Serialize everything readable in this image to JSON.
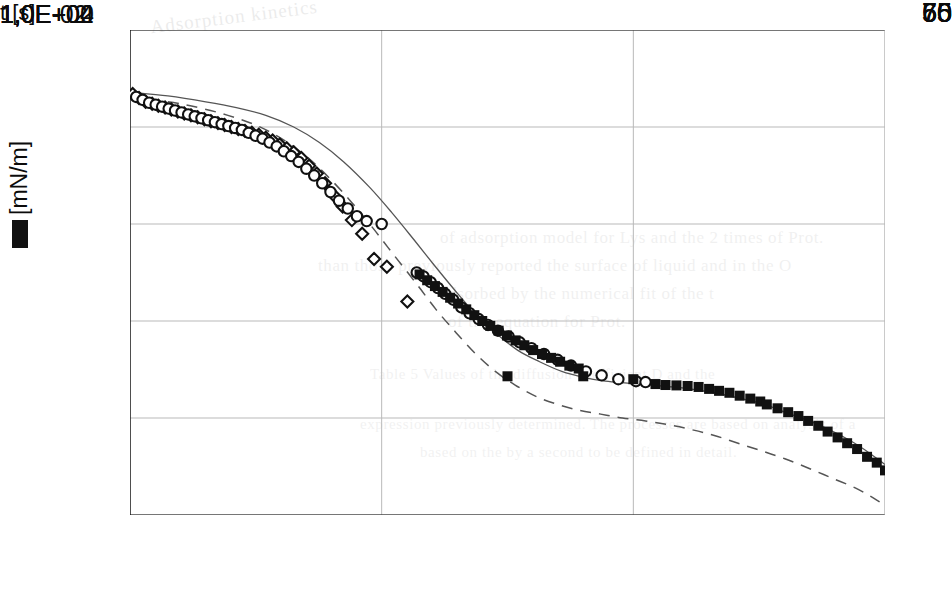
{
  "figure": {
    "axis_color": "#111111",
    "grid_color": "#b9b9b9",
    "marker_color": "#111111",
    "fit_color": "#555555"
  },
  "yaxis": {
    "title_symbol": "redacted-gamma-symbol",
    "title_units": "[mN/m]",
    "ticks": [
      "75",
      "70",
      "65",
      "60",
      "55",
      "50"
    ]
  },
  "xaxis": {
    "title": "t [s]",
    "ticks": [
      "1,0E-02",
      "1,0E+00",
      "1,0E+02",
      "1,0E+04"
    ]
  },
  "background_text": {
    "header": "Adsorption kinetics",
    "lines": [
      "of  adsorption  model  for  Lys  and  the  2  times  of  Prot.",
      "than  those  previously  reported  the  surface  of  liquid  and  in  the  O",
      "adsorbed  by  the  numerical  fit  of  the  t",
      "of  the  equation  for  Prot.",
      "Table 5  Values  of  the  diffusion  coefficient  D  and  the",
      "expression  previously  determined.  The  processes  are  based  on  analysis  of  a",
      "based  on  the  by  a  second  to  be  defined  in  detail."
    ]
  },
  "chart_data": {
    "type": "scatter",
    "title": "",
    "xlabel": "t [s]",
    "ylabel": "[mN/m]",
    "xscale": "log",
    "xlim": [
      0.01,
      10000
    ],
    "ylim": [
      50,
      75
    ],
    "xticks": [
      0.01,
      1,
      100,
      10000
    ],
    "xticklabels": [
      "1,0E-02",
      "1,0E+00",
      "1,0E+02",
      "1,0E+04"
    ],
    "yticks": [
      50,
      55,
      60,
      65,
      70,
      75
    ],
    "grid": true,
    "legend": "none",
    "series": [
      {
        "name": "open-diamonds",
        "marker": "open-diamond",
        "points": [
          [
            0.0105,
            71.7
          ],
          [
            0.0118,
            71.5
          ],
          [
            0.0133,
            71.3
          ],
          [
            0.015,
            71.2
          ],
          [
            0.0168,
            71.1
          ],
          [
            0.019,
            71.0
          ],
          [
            0.0213,
            70.9
          ],
          [
            0.024,
            70.8
          ],
          [
            0.027,
            70.7
          ],
          [
            0.0305,
            70.6
          ],
          [
            0.0345,
            70.5
          ],
          [
            0.039,
            70.4
          ],
          [
            0.044,
            70.3
          ],
          [
            0.05,
            70.2
          ],
          [
            0.0565,
            70.1
          ],
          [
            0.064,
            70.0
          ],
          [
            0.0725,
            69.9
          ],
          [
            0.082,
            69.8
          ],
          [
            0.093,
            69.7
          ],
          [
            0.1055,
            69.6
          ],
          [
            0.12,
            69.45
          ],
          [
            0.136,
            69.3
          ],
          [
            0.155,
            69.1
          ],
          [
            0.176,
            68.9
          ],
          [
            0.2,
            68.7
          ],
          [
            0.23,
            68.4
          ],
          [
            0.265,
            68.0
          ],
          [
            0.305,
            67.6
          ],
          [
            0.355,
            67.1
          ],
          [
            0.415,
            66.5
          ],
          [
            0.49,
            65.9
          ],
          [
            0.58,
            65.2
          ],
          [
            0.7,
            64.5
          ],
          [
            0.87,
            63.2
          ],
          [
            1.1,
            62.8
          ],
          [
            1.6,
            61.0
          ]
        ]
      },
      {
        "name": "open-circles",
        "marker": "open-circle",
        "points": [
          [
            0.0112,
            71.55
          ],
          [
            0.0126,
            71.4
          ],
          [
            0.0142,
            71.25
          ],
          [
            0.016,
            71.15
          ],
          [
            0.018,
            71.05
          ],
          [
            0.0203,
            70.95
          ],
          [
            0.0228,
            70.85
          ],
          [
            0.0257,
            70.75
          ],
          [
            0.029,
            70.65
          ],
          [
            0.0327,
            70.55
          ],
          [
            0.037,
            70.45
          ],
          [
            0.0418,
            70.35
          ],
          [
            0.0473,
            70.25
          ],
          [
            0.0535,
            70.15
          ],
          [
            0.0605,
            70.05
          ],
          [
            0.0685,
            69.95
          ],
          [
            0.0775,
            69.85
          ],
          [
            0.0878,
            69.7
          ],
          [
            0.0995,
            69.55
          ],
          [
            0.113,
            69.4
          ],
          [
            0.1285,
            69.2
          ],
          [
            0.1465,
            69.0
          ],
          [
            0.167,
            68.75
          ],
          [
            0.191,
            68.5
          ],
          [
            0.219,
            68.2
          ],
          [
            0.252,
            67.85
          ],
          [
            0.291,
            67.5
          ],
          [
            0.337,
            67.1
          ],
          [
            0.392,
            66.65
          ],
          [
            0.458,
            66.2
          ],
          [
            0.538,
            65.8
          ],
          [
            0.636,
            65.4
          ],
          [
            0.76,
            65.15
          ],
          [
            1.0,
            65.0
          ],
          [
            1.9,
            62.5
          ],
          [
            2.15,
            62.3
          ],
          [
            2.45,
            62.0
          ],
          [
            2.8,
            61.7
          ],
          [
            3.2,
            61.4
          ],
          [
            3.7,
            61.1
          ],
          [
            4.3,
            60.7
          ],
          [
            5.0,
            60.4
          ],
          [
            5.9,
            60.1
          ],
          [
            7.0,
            59.8
          ],
          [
            8.4,
            59.5
          ],
          [
            10.2,
            59.2
          ],
          [
            12.5,
            58.9
          ],
          [
            15.5,
            58.6
          ],
          [
            19.5,
            58.3
          ],
          [
            25.0,
            58.0
          ],
          [
            32.0,
            57.7
          ],
          [
            42.0,
            57.4
          ],
          [
            56.0,
            57.2
          ],
          [
            76.0,
            57.0
          ],
          [
            105.0,
            56.9
          ],
          [
            125.0,
            56.85
          ]
        ]
      },
      {
        "name": "filled-squares",
        "marker": "filled-square",
        "points": [
          [
            2.0,
            62.4
          ],
          [
            2.3,
            62.1
          ],
          [
            2.65,
            61.8
          ],
          [
            3.05,
            61.5
          ],
          [
            3.5,
            61.2
          ],
          [
            4.05,
            60.9
          ],
          [
            4.7,
            60.6
          ],
          [
            5.45,
            60.3
          ],
          [
            6.3,
            60.0
          ],
          [
            7.3,
            59.75
          ],
          [
            8.5,
            59.5
          ],
          [
            9.9,
            59.25
          ],
          [
            11.6,
            59.0
          ],
          [
            13.6,
            58.75
          ],
          [
            16.0,
            58.5
          ],
          [
            18.8,
            58.3
          ],
          [
            22.2,
            58.1
          ],
          [
            26.2,
            57.9
          ],
          [
            31.0,
            57.7
          ],
          [
            36.8,
            57.55
          ],
          [
            10.0,
            57.15
          ],
          [
            40.0,
            57.15
          ],
          [
            100.0,
            57.0
          ],
          [
            150.0,
            56.75
          ],
          [
            180.0,
            56.7
          ],
          [
            220.0,
            56.68
          ],
          [
            270.0,
            56.65
          ],
          [
            330.0,
            56.6
          ],
          [
            400.0,
            56.5
          ],
          [
            480.0,
            56.4
          ],
          [
            580.0,
            56.3
          ],
          [
            700.0,
            56.15
          ],
          [
            850.0,
            56.0
          ],
          [
            1020.0,
            55.85
          ],
          [
            1150.0,
            55.7
          ],
          [
            1400.0,
            55.5
          ],
          [
            1700.0,
            55.3
          ],
          [
            2050.0,
            55.1
          ],
          [
            2450.0,
            54.85
          ],
          [
            2950.0,
            54.6
          ],
          [
            3500.0,
            54.3
          ],
          [
            4200.0,
            54.0
          ],
          [
            5000.0,
            53.7
          ],
          [
            6000.0,
            53.4
          ],
          [
            7200.0,
            53.0
          ],
          [
            8600.0,
            52.7
          ],
          [
            10000.0,
            52.3
          ]
        ]
      }
    ],
    "curves": [
      {
        "name": "solid-fit-curve",
        "style": "solid",
        "points": [
          [
            0.01,
            71.8
          ],
          [
            0.02,
            71.6
          ],
          [
            0.04,
            71.3
          ],
          [
            0.07,
            71.0
          ],
          [
            0.12,
            70.6
          ],
          [
            0.2,
            70.0
          ],
          [
            0.32,
            69.2
          ],
          [
            0.5,
            68.2
          ],
          [
            0.8,
            66.9
          ],
          [
            1.2,
            65.6
          ],
          [
            1.8,
            64.2
          ],
          [
            2.6,
            62.9
          ],
          [
            3.8,
            61.6
          ],
          [
            5.5,
            60.4
          ],
          [
            8.0,
            59.4
          ],
          [
            12.0,
            58.5
          ],
          [
            18.0,
            57.9
          ],
          [
            27.0,
            57.4
          ],
          [
            40.0,
            57.1
          ],
          [
            60.0,
            56.9
          ],
          [
            90.0,
            56.8
          ],
          [
            140.0,
            56.7
          ],
          [
            210.0,
            56.6
          ],
          [
            320.0,
            56.45
          ],
          [
            480.0,
            56.25
          ],
          [
            720.0,
            56.0
          ],
          [
            1100.0,
            55.7
          ],
          [
            1600.0,
            55.3
          ],
          [
            2400.0,
            54.9
          ],
          [
            3600.0,
            54.4
          ],
          [
            5400.0,
            53.8
          ],
          [
            7500.0,
            53.2
          ],
          [
            10000.0,
            52.6
          ]
        ]
      },
      {
        "name": "dashed-fit-curve",
        "style": "dashed",
        "points": [
          [
            0.01,
            71.5
          ],
          [
            0.02,
            71.3
          ],
          [
            0.035,
            71.0
          ],
          [
            0.06,
            70.6
          ],
          [
            0.1,
            70.1
          ],
          [
            0.16,
            69.4
          ],
          [
            0.25,
            68.5
          ],
          [
            0.38,
            67.4
          ],
          [
            0.58,
            66.1
          ],
          [
            0.85,
            64.8
          ],
          [
            1.25,
            63.4
          ],
          [
            1.85,
            62.0
          ],
          [
            2.7,
            60.6
          ],
          [
            3.9,
            59.4
          ],
          [
            5.6,
            58.3
          ],
          [
            8.0,
            57.4
          ],
          [
            11.5,
            56.7
          ],
          [
            17.0,
            56.1
          ],
          [
            25.0,
            55.7
          ],
          [
            37.0,
            55.4
          ],
          [
            55.0,
            55.2
          ],
          [
            82.0,
            55.0
          ],
          [
            125.0,
            54.85
          ],
          [
            190.0,
            54.65
          ],
          [
            290.0,
            54.4
          ],
          [
            440.0,
            54.1
          ],
          [
            680.0,
            53.7
          ],
          [
            1050.0,
            53.3
          ],
          [
            1600.0,
            52.9
          ],
          [
            2500.0,
            52.4
          ],
          [
            3800.0,
            51.9
          ],
          [
            5800.0,
            51.4
          ],
          [
            8000.0,
            50.9
          ],
          [
            10000.0,
            50.5
          ]
        ]
      }
    ]
  }
}
